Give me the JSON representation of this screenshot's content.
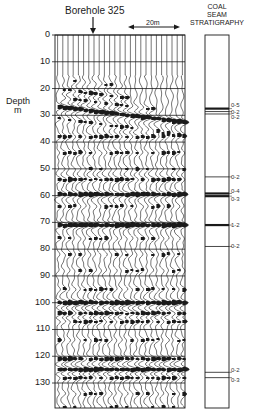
{
  "figure": {
    "borehole_label": "Borehole 325",
    "scale_bar_label": "20m",
    "depth_axis_label_line1": "Depth",
    "depth_axis_label_line2": "m",
    "strat_header_line1": "COAL",
    "strat_header_line2": "SEAM",
    "strat_header_line3": "STRATIGRAPHY"
  },
  "depth_axis": {
    "ticks": [
      "0",
      "10",
      "20",
      "30",
      "40",
      "50",
      "60",
      "70",
      "80",
      "90",
      "100",
      "110",
      "120",
      "130"
    ],
    "min": 0,
    "max": 140,
    "unit": "m"
  },
  "seams": [
    {
      "depth": 27.5,
      "thickness_label": "0-5",
      "thick": true
    },
    {
      "depth": 28.6,
      "thickness_label": "0-2",
      "thick": false
    },
    {
      "depth": 29.5,
      "thickness_label": "0-2",
      "thick": false
    },
    {
      "depth": 53.0,
      "thickness_label": "0-2",
      "thick": false
    },
    {
      "depth": 59.2,
      "thickness_label": "0-4",
      "thick": true
    },
    {
      "depth": 60.2,
      "thickness_label": "0-3",
      "thick": true
    },
    {
      "depth": 71.0,
      "thickness_label": "1-2",
      "thick": true
    },
    {
      "depth": 79.0,
      "thickness_label": "0-2",
      "thick": false
    },
    {
      "depth": 126.0,
      "thickness_label": "0-2",
      "thick": false
    },
    {
      "depth": 128.0,
      "thickness_label": "0-3",
      "thick": false
    }
  ],
  "colors": {
    "ink": "#1a1a1a",
    "paper": "#ffffff"
  }
}
